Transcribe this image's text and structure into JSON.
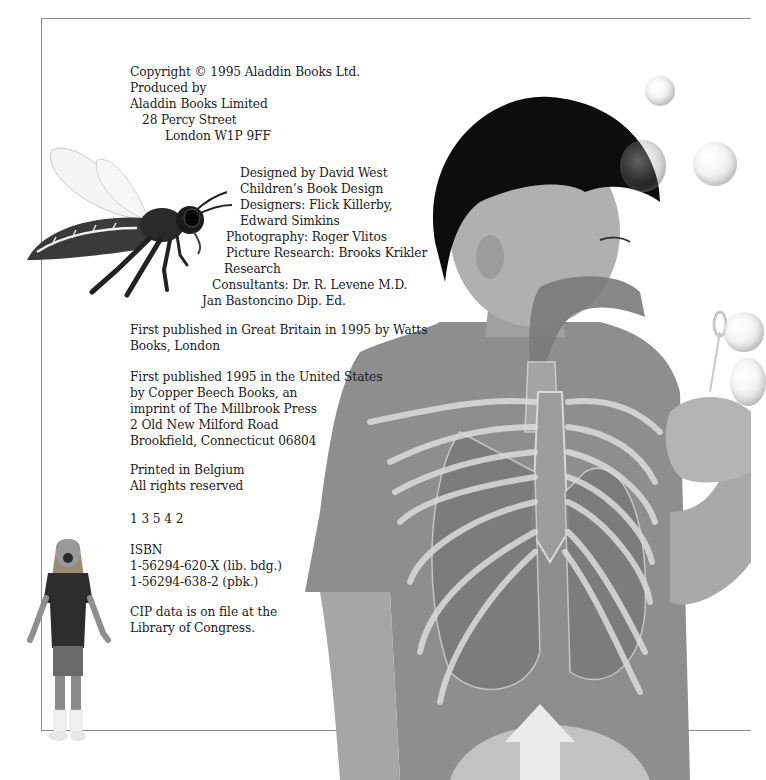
{
  "copyright_page": {
    "publisher_block": [
      "Copyright © 1995 Aladdin Books Ltd.",
      "Produced by",
      "Aladdin Books Limited",
      "28 Percy Street",
      "London W1P 9FF"
    ],
    "credits_block": [
      "Designed by David West",
      "Children’s Book Design",
      "Designers: Flick Killerby,",
      "Edward Simkins",
      "Photography: Roger Vlitos",
      "Picture Research: Brooks Krikler",
      "Research",
      "Consultants: Dr. R. Levene M.D.",
      "Jan Bastoncino Dip. Ed."
    ],
    "uk_publication": [
      "First published in Great Britain in 1995 by Watts",
      "Books, London"
    ],
    "us_publication": [
      "First published 1995 in the United States",
      "by Copper Beech Books, an",
      "imprint of The Millbrook Press",
      "2 Old New Milford Road",
      "Brookfield, Connecticut 06804"
    ],
    "printing": [
      "Printed in Belgium",
      "All rights reserved"
    ],
    "printing_sequence": "1 3 5 4 2",
    "isbn": [
      "ISBN",
      "1-56294-620-X (lib. bdg.)",
      "1-56294-638-2 (pbk.)"
    ],
    "cip": [
      "CIP data is on file at the",
      "Library of Congress."
    ]
  },
  "illustrations": {
    "bee": "bee-illustration",
    "girl": "girl-shouting-photo",
    "boy": "boy-blowing-bubbles-with-ribcage-overlay",
    "arrow": "diaphragm-up-arrow"
  },
  "colors": {
    "frame": "#8a8a8a",
    "text": "#1c1c1c",
    "shirt": "#8c8c8c",
    "hair": "#0d0d0d",
    "skin": "#a9a9a9"
  }
}
